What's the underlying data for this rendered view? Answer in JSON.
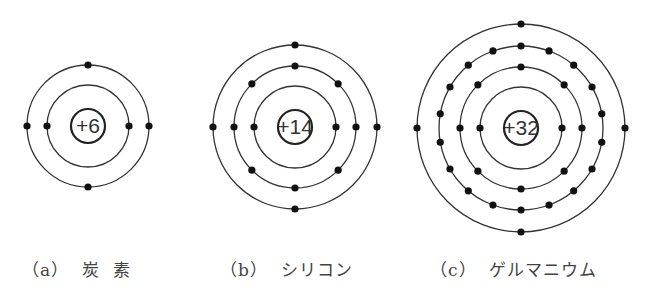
{
  "atoms": [
    {
      "id": "carbon",
      "label": "（a）  炭  素",
      "charge": "+6",
      "cx": 88,
      "cy": 126,
      "shells": [
        2,
        4
      ],
      "label_x": 22
    },
    {
      "id": "silicon",
      "label": "（b）  シリコン",
      "charge": "+14",
      "cx": 295,
      "cy": 127,
      "shells": [
        2,
        8,
        4
      ],
      "label_x": 220
    },
    {
      "id": "germanium",
      "label": "（c）  ゲルマニウム",
      "charge": "+32",
      "cx": 521,
      "cy": 128,
      "shells": [
        2,
        8,
        18,
        4
      ],
      "label_x": 430
    }
  ],
  "geometry": {
    "nucleus_r": 17,
    "shell_radii": [
      41,
      61,
      82,
      104
    ],
    "electron_r": 3.6
  },
  "colors": {
    "line": "#333333",
    "electron": "#111111",
    "text": "#444444"
  }
}
